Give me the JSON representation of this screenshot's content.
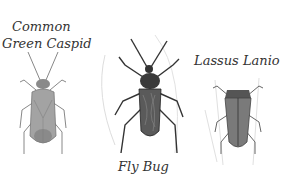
{
  "top_title_clipped": "———————— ————",
  "bugs": [
    {
      "name_line1": "Common",
      "name_line2": "Green Caspid",
      "body_color": "#9a9a9a"
    },
    {
      "name": "Fly Bug",
      "body_color": "#4a4a4a"
    },
    {
      "name": "Lassus Lanio",
      "body_color": "#6e6e6e"
    }
  ]
}
